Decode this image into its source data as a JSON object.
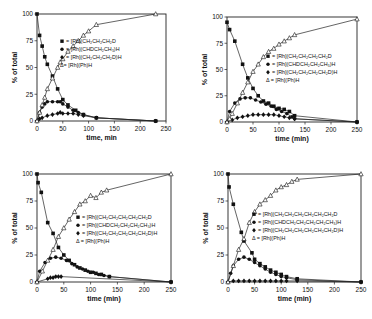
{
  "chart_data": [
    {
      "type": "scatter",
      "panel": "top-left",
      "title": "",
      "xlabel": "time, min",
      "ylabel": "% of total",
      "xlim": [
        0,
        250
      ],
      "ylim": [
        0,
        100
      ],
      "xticks": [
        0,
        50,
        100,
        150,
        200,
        250
      ],
      "yticks": [
        0,
        25,
        50,
        75,
        100
      ],
      "grid": false,
      "legend_position": "center-right",
      "frame": {
        "left": 37,
        "top": 14,
        "right": 166,
        "bottom": 121
      },
      "series": [
        {
          "name": "= [Rh](CH2CH2CH2D",
          "label": "= [Rh](CH₂CH₂CH₂D",
          "marker": "square",
          "x": [
            0,
            5,
            10,
            15,
            20,
            30,
            40,
            50,
            60,
            75,
            90,
            115,
            230
          ],
          "y": [
            100,
            80,
            70,
            60,
            53,
            42,
            30,
            20,
            15,
            10,
            6,
            3,
            0
          ]
        },
        {
          "name": "= [Rh](CHDCH2CH3)H",
          "label": "= [Rh](CHDCH₂CH₃)H",
          "marker": "circle",
          "x": [
            0,
            5,
            10,
            15,
            20,
            30,
            40,
            45,
            50,
            60,
            70,
            80,
            90,
            115,
            230
          ],
          "y": [
            0,
            8,
            13,
            16,
            18,
            18,
            18,
            18,
            16,
            13,
            10,
            8,
            6,
            3,
            0
          ]
        },
        {
          "name": "= [Rh](CH2CH2CH2D)H",
          "label": "= [Rh](CH₂CH₂CH₂D)H",
          "marker": "diamond",
          "x": [
            0,
            5,
            10,
            20,
            30,
            40,
            45,
            50,
            60,
            70,
            80,
            90,
            115,
            230
          ],
          "y": [
            0,
            2,
            3,
            5,
            6,
            7,
            8,
            7,
            7,
            7,
            6,
            5,
            3,
            0
          ]
        },
        {
          "name": "= [Rh](Ph)H",
          "label": "Δ= [Rh](Ph)H",
          "marker": "triangle",
          "x": [
            0,
            5,
            10,
            15,
            20,
            30,
            40,
            45,
            50,
            60,
            70,
            80,
            90,
            100,
            115,
            230
          ],
          "y": [
            0,
            8,
            15,
            22,
            30,
            40,
            50,
            55,
            58,
            65,
            70,
            75,
            80,
            84,
            90,
            100
          ]
        }
      ],
      "legend": {
        "x": 60,
        "y": 43,
        "lines": [
          {
            "marker": "square",
            "text": "= [Rh](CH₂CH₂CH₂D"
          },
          {
            "marker": "circle",
            "text": "= [Rh](CHDCH₂CH₃)H"
          },
          {
            "marker": "diamond",
            "text": "= [Rh](CH₂CH₂CH₂D)H"
          },
          {
            "marker": "triangle",
            "text": "Δ= [Rh](Ph)H"
          }
        ]
      }
    },
    {
      "type": "scatter",
      "panel": "top-right",
      "title": "",
      "xlabel": "time (min)",
      "ylabel": "% of total",
      "xlim": [
        0,
        250
      ],
      "ylim": [
        0,
        100
      ],
      "xticks": [
        0,
        50,
        100,
        150,
        200,
        250
      ],
      "yticks": [
        0,
        25,
        50,
        75,
        100
      ],
      "grid": false,
      "legend_position": "center-right",
      "frame": {
        "left": 227,
        "top": 17,
        "right": 357,
        "bottom": 122
      },
      "series": [
        {
          "name": "= [Rh](CH2CH2CH2CH2D",
          "label": "= [Rh](CH₂CH₂CH₂CH₂D",
          "marker": "square",
          "x": [
            0,
            5,
            15,
            30,
            40,
            50,
            60,
            70,
            80,
            90,
            100,
            110,
            120,
            130,
            250
          ],
          "y": [
            95,
            88,
            77,
            55,
            42,
            32,
            25,
            20,
            18,
            15,
            13,
            12,
            10,
            6,
            0
          ]
        },
        {
          "name": "= [Rh](CHDCH2CH2CH3)H",
          "label": "= [Rh](CHDCH₂CH₂CH₃)H",
          "marker": "circle",
          "x": [
            0,
            5,
            15,
            25,
            35,
            45,
            55,
            65,
            75,
            85,
            95,
            105,
            115,
            125,
            130,
            250
          ],
          "y": [
            0,
            10,
            18,
            22,
            23,
            23,
            21,
            19,
            17,
            15,
            12,
            10,
            8,
            5,
            3,
            0
          ]
        },
        {
          "name": "= [Rh](CH2CH2CH2CH2D)H",
          "label": "= [Rh](CH₂CH₂CH₂CH₂D)H",
          "marker": "diamond",
          "x": [
            0,
            10,
            20,
            30,
            40,
            50,
            60,
            70,
            80,
            90,
            100,
            110,
            120,
            130,
            250
          ],
          "y": [
            0,
            2,
            4,
            5,
            6,
            7,
            7,
            7,
            7,
            7,
            6,
            5,
            4,
            3,
            0
          ]
        },
        {
          "name": "= [Rh](Ph)H",
          "label": "Δ = [Rh](Ph)H",
          "marker": "triangle",
          "x": [
            0,
            5,
            10,
            20,
            30,
            40,
            50,
            60,
            70,
            80,
            90,
            100,
            110,
            120,
            130,
            250
          ],
          "y": [
            0,
            3,
            8,
            18,
            28,
            38,
            48,
            55,
            62,
            67,
            70,
            74,
            77,
            80,
            83,
            98
          ]
        }
      ],
      "legend": {
        "x": 266,
        "y": 58,
        "lines": [
          {
            "marker": "square",
            "text": "= [Rh](CH₂CH₂CH₂CH₂D"
          },
          {
            "marker": "circle",
            "text": "= [Rh](CHDCH₂CH₂CH₃)H"
          },
          {
            "marker": "diamond",
            "text": "= [Rh](CH₂CH₂CH₂CH₂D)H"
          },
          {
            "marker": "triangle",
            "text": "Δ = [Rh](Ph)H"
          }
        ]
      }
    },
    {
      "type": "scatter",
      "panel": "bottom-left",
      "title": "",
      "xlabel": "time (min)",
      "ylabel": "% of total",
      "xlim": [
        0,
        250
      ],
      "ylim": [
        0,
        100
      ],
      "xticks": [
        0,
        50,
        100,
        150,
        200,
        250
      ],
      "yticks": [
        0,
        25,
        50,
        75,
        100
      ],
      "grid": false,
      "legend_position": "center-right",
      "frame": {
        "left": 37,
        "top": 174,
        "right": 171,
        "bottom": 282
      },
      "series": [
        {
          "name": "= [Rh](CH2CH2CH2CH2CH2D",
          "label": "= [Rh](CH₂CH₂CH₂CH₂CH₂D",
          "marker": "square",
          "x": [
            0,
            2,
            8,
            20,
            30,
            40,
            50,
            60,
            70,
            80,
            90,
            100,
            110,
            120,
            135,
            250
          ],
          "y": [
            100,
            92,
            83,
            55,
            45,
            32,
            25,
            20,
            16,
            13,
            11,
            9,
            8,
            7,
            5,
            0
          ]
        },
        {
          "name": "= [Rh](CHDCH2CH2CH2CH3)H",
          "label": "= [Rh](CHDCH₂CH₂CH₂CH₃)H",
          "marker": "circle",
          "x": [
            0,
            5,
            15,
            25,
            35,
            45,
            55,
            65,
            75,
            85,
            95,
            105,
            115,
            125,
            135,
            250
          ],
          "y": [
            0,
            10,
            18,
            22,
            23,
            22,
            20,
            17,
            14,
            12,
            10,
            9,
            7,
            6,
            5,
            0
          ]
        },
        {
          "name": "= [Rh](CH2CH2CH2CH2CH2D)H",
          "label": "= [Rh](CH₂CH₂CH₂CH₂CH₂D)H",
          "marker": "diamond",
          "x": [
            0,
            20,
            25,
            30,
            35,
            40,
            45,
            250
          ],
          "y": [
            0,
            3,
            4,
            4,
            5,
            5,
            5,
            0
          ]
        },
        {
          "name": "= [Rh](Ph)H",
          "label": "Δ = [Rh](Ph)H",
          "marker": "triangle",
          "x": [
            0,
            10,
            20,
            30,
            40,
            50,
            60,
            70,
            80,
            90,
            100,
            110,
            120,
            130,
            250
          ],
          "y": [
            0,
            10,
            20,
            30,
            42,
            50,
            58,
            65,
            72,
            75,
            80,
            78,
            83,
            85,
            100
          ]
        }
      ],
      "legend": {
        "x": 76,
        "y": 219,
        "lines": [
          {
            "marker": "square",
            "text": "= [Rh](CH₂CH₂CH₂CH₂CH₂D"
          },
          {
            "marker": "circle",
            "text": "= [Rh](CHDCH₂CH₂CH₂CH₃)H"
          },
          {
            "marker": "diamond",
            "text": "= [Rh](CH₂CH₂CH₂CH₂CH₂D)H"
          },
          {
            "marker": "triangle",
            "text": "Δ = [Rh](Ph)H"
          }
        ]
      }
    },
    {
      "type": "scatter",
      "panel": "bottom-right",
      "title": "",
      "xlabel": "time (min)",
      "ylabel": "% of total",
      "xlim": [
        0,
        250
      ],
      "ylim": [
        0,
        100
      ],
      "xticks": [
        0,
        50,
        100,
        150,
        200,
        250
      ],
      "yticks": [
        0,
        25,
        50,
        75,
        100
      ],
      "grid": false,
      "legend_position": "center-right",
      "frame": {
        "left": 228,
        "top": 174,
        "right": 361,
        "bottom": 282
      },
      "series": [
        {
          "name": "= [Rh](CH2CH2CH2CH2CH2CH2D",
          "label": "= [Rh](CH₂CH₂CH₂CH₂CH₂CH₂D",
          "marker": "square",
          "x": [
            0,
            2,
            10,
            25,
            30,
            45,
            50,
            60,
            70,
            80,
            90,
            100,
            110,
            130,
            250
          ],
          "y": [
            100,
            88,
            72,
            46,
            38,
            27,
            21,
            17,
            14,
            11,
            9,
            7,
            5,
            3,
            0
          ]
        },
        {
          "name": "= [Rh](CHDCH2CH2CH2CH2CH3)H",
          "label": "= [Rh](CHDCH₂CH₂CH₂CH₂CH₃)H",
          "marker": "circle",
          "x": [
            0,
            5,
            10,
            20,
            30,
            40,
            50,
            60,
            70,
            80,
            90,
            100,
            110,
            130,
            250
          ],
          "y": [
            0,
            8,
            15,
            21,
            23,
            21,
            18,
            15,
            12,
            9,
            7,
            5,
            4,
            2,
            0
          ]
        },
        {
          "name": "= [Rh](CH2CH2CH2CH2CH2CH2D)H",
          "label": "= [Rh](CH₂CH₂CH₂CH₂CH₂CH₂D)H",
          "marker": "diamond",
          "x": [
            0,
            10,
            20,
            30,
            40,
            50,
            60,
            70,
            80,
            90,
            100,
            110,
            130,
            250
          ],
          "y": [
            0,
            1,
            1,
            1,
            1,
            1,
            1,
            1,
            1,
            1,
            1,
            1,
            1,
            0
          ]
        },
        {
          "name": "= [Rh](Ph)H",
          "label": "Δ = [Rh](Ph)H",
          "marker": "triangle",
          "x": [
            0,
            10,
            20,
            30,
            40,
            50,
            60,
            70,
            80,
            90,
            100,
            110,
            120,
            130,
            250
          ],
          "y": [
            0,
            15,
            30,
            40,
            55,
            65,
            72,
            76,
            80,
            85,
            88,
            90,
            93,
            95,
            100
          ]
        }
      ],
      "legend": {
        "x": 252,
        "y": 216,
        "lines": [
          {
            "marker": "square",
            "text": "= [Rh](CH₂CH₂CH₂CH₂CH₂CH₂D"
          },
          {
            "marker": "circle",
            "text": "= [Rh](CHDCH₂CH₂CH₂CH₂CH₃)H"
          },
          {
            "marker": "diamond",
            "text": "= [Rh](CH₂CH₂CH₂CH₂CH₂CH₂D)H"
          },
          {
            "marker": "triangle",
            "text": "Δ = [Rh](Ph)H"
          }
        ]
      }
    }
  ]
}
